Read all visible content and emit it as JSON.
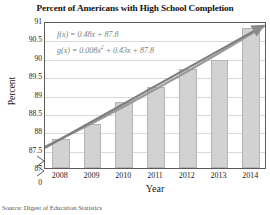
{
  "chart_data": {
    "type": "bar",
    "title": "Percent of Americans with High School Completion",
    "xlabel": "Year",
    "ylabel": "Percent",
    "categories": [
      "2008",
      "2009",
      "2010",
      "2011",
      "2012",
      "2013",
      "2014"
    ],
    "values": [
      87.8,
      88.2,
      88.8,
      89.2,
      89.7,
      89.95,
      90.8
    ],
    "ylim": [
      87,
      91
    ],
    "ytick_labels": [
      "91",
      "90.5",
      "90",
      "89.5",
      "89",
      "88.5",
      "88",
      "87.5",
      "87",
      "0"
    ],
    "ytick_values": [
      91,
      90.5,
      90,
      89.5,
      89,
      88.5,
      88,
      87.5,
      87,
      0
    ],
    "y_axis_break": true,
    "grid": true,
    "legend": "none",
    "series": [
      {
        "name": "Percent with high school completion",
        "values": [
          87.8,
          88.2,
          88.8,
          89.2,
          89.7,
          89.95,
          90.8
        ]
      },
      {
        "name": "f(x) = 0.48x + 87.8",
        "type": "line",
        "values": [
          87.8,
          88.28,
          88.76,
          89.24,
          89.72,
          90.2,
          90.68
        ]
      },
      {
        "name": "g(x) = 0.008x² + 0.43x + 87.8",
        "type": "line",
        "values": [
          87.8,
          88.238,
          88.692,
          89.162,
          89.648,
          90.15,
          90.668
        ]
      }
    ],
    "annotations": [
      {
        "name": "linear-model",
        "text": "f(x) = 0.48x + 87.8"
      },
      {
        "name": "quadratic-model",
        "text": "g(x) = 0.008x² + 0.43x + 87.8"
      }
    ],
    "source": "Source: Digest of Education Statistics",
    "colors": {
      "bar_fill": "#d2d2d2",
      "bar_edge": "#b4b4b4",
      "trend_line": "#8a8a8a",
      "grid": "#d9d9d9",
      "axis": "#5a5a5a",
      "equation_text": "#7d7d7d"
    }
  },
  "equations": {
    "linear_prefix": "f(x) = 0.48x + 87.8",
    "quad_head": "g(x) = 0.008x",
    "quad_exp": "2",
    "quad_tail": " + 0.43x + 87.8"
  }
}
